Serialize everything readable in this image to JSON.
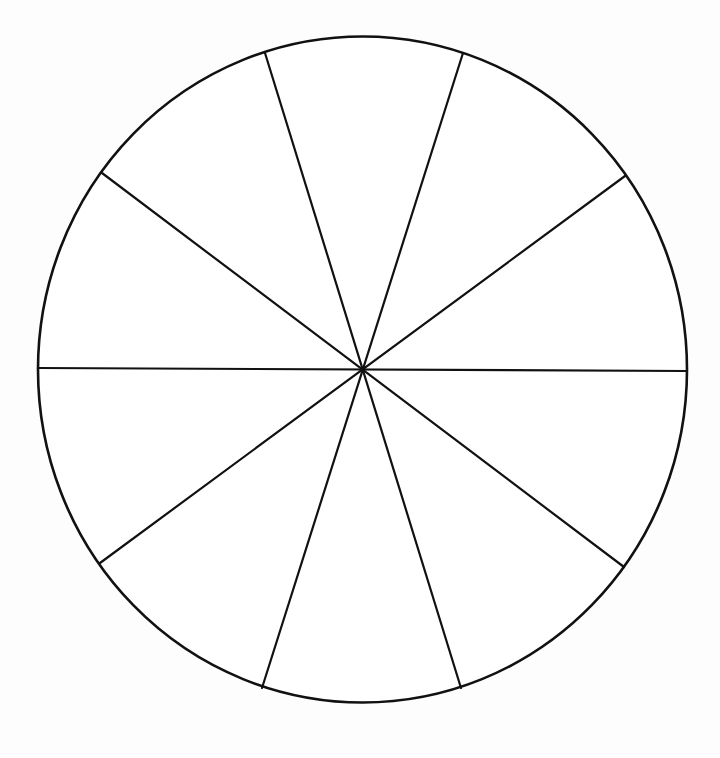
{
  "diagram": {
    "type": "segmented-circle",
    "segment_count": 10,
    "diameter_count": 5,
    "segment_angle_deg": 36,
    "center": {
      "x": 362.5,
      "y": 369.5
    },
    "radius_x": 324.5,
    "radius_y": 333,
    "stroke_color": "#111111",
    "fill_color": "#ffffff",
    "diameters": [
      {
        "name": "horizontal",
        "x1": 38,
        "y1": 368,
        "x2": 687,
        "y2": 371
      },
      {
        "name": "diag-36",
        "x1": 102,
        "y1": 173,
        "x2": 624,
        "y2": 567
      },
      {
        "name": "diag-72",
        "x1": 265,
        "y1": 53,
        "x2": 461,
        "y2": 688
      },
      {
        "name": "diag-108",
        "x1": 463,
        "y1": 53,
        "x2": 262,
        "y2": 688
      },
      {
        "name": "diag-144",
        "x1": 625,
        "y1": 176,
        "x2": 100,
        "y2": 563
      }
    ]
  }
}
